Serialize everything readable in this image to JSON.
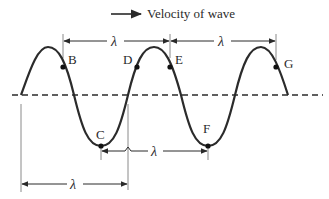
{
  "diagram": {
    "velocity_label": "Velocity of wave",
    "wavelength_symbol": "λ",
    "colors": {
      "wave": "#2b2b2b",
      "axis": "#2b2b2b",
      "guides": "#8a8a8a",
      "text": "#2a2a2a"
    },
    "points": [
      {
        "label": "B",
        "x": 63,
        "y": 66
      },
      {
        "label": "C",
        "x": 101,
        "y": 146
      },
      {
        "label": "D",
        "x": 137,
        "y": 66
      },
      {
        "label": "E",
        "x": 170,
        "y": 66
      },
      {
        "label": "F",
        "x": 208,
        "y": 146
      },
      {
        "label": "G",
        "x": 276,
        "y": 66
      }
    ],
    "wavelength_markers": [
      {
        "from": "B",
        "to": "E",
        "label": "λ"
      },
      {
        "from": "E",
        "to": "G",
        "label": "λ"
      },
      {
        "from": "C",
        "to": "F",
        "label": "λ"
      },
      {
        "from": "start",
        "to": "one-wavelength",
        "label": "λ"
      }
    ]
  }
}
